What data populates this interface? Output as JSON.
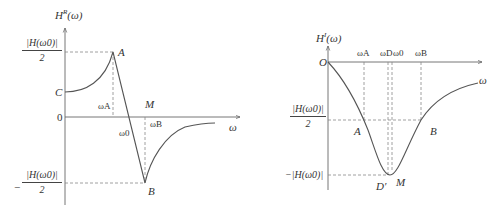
{
  "left_plot": {
    "y_axis_label": "HR(ω)",
    "y_axis_label_main": "H",
    "y_axis_label_sup": "R",
    "y_axis_label_arg": "(ω)",
    "x_axis_label": "ω",
    "origin_label": "0",
    "top_fraction_num": "|H(ω0)|",
    "top_fraction_den": "2",
    "bottom_fraction_sign": "−",
    "bottom_fraction_num": "|H(ω0)|",
    "bottom_fraction_den": "2",
    "points": {
      "A": "A",
      "B": "B",
      "C": "C",
      "M": "M"
    },
    "omega_A": "ωA",
    "omega_0": "ω0",
    "omega_B": "ωB"
  },
  "right_plot": {
    "y_axis_label_main": "H",
    "y_axis_label_sup": "I",
    "y_axis_label_arg": "(ω)",
    "x_axis_label": "ω",
    "origin_label": "O",
    "mid_fraction_num": "|H(ω0)|",
    "mid_fraction_den": "2",
    "min_label": "−|H(ω0)|",
    "points": {
      "A": "A",
      "B": "B",
      "D": "D′",
      "M": "M"
    },
    "omega_A": "ωA",
    "omega_D": "ωD",
    "omega_0": "ω0",
    "omega_B": "ωB"
  },
  "colors": {
    "curve": "#555555",
    "axis": "#666666",
    "dash": "#888888"
  }
}
